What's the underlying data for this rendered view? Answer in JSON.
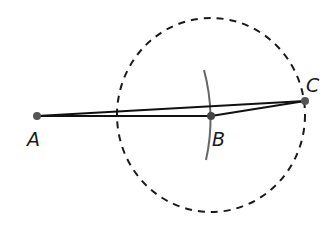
{
  "diagram": {
    "type": "geometric-construction",
    "points": [
      {
        "id": "A",
        "label": "A",
        "x": 37,
        "y": 116,
        "label_x": 27,
        "label_y": 146
      },
      {
        "id": "B",
        "label": "B",
        "x": 211,
        "y": 116,
        "label_x": 212,
        "label_y": 146
      },
      {
        "id": "C",
        "label": "C",
        "x": 305,
        "y": 101,
        "label_x": 306,
        "label_y": 92
      }
    ],
    "segments": [
      {
        "from": "A",
        "to": "B"
      },
      {
        "from": "B",
        "to": "C"
      },
      {
        "from": "A",
        "to": "C"
      }
    ],
    "circle": {
      "center": "B",
      "cx": 211,
      "cy": 115,
      "rx": 94,
      "ry": 97,
      "style": "dashed"
    },
    "arc": {
      "through": "B",
      "style": "solid",
      "color": "#555555"
    },
    "colors": {
      "line": "#111111",
      "point": "#555555",
      "arc": "#666666",
      "dashed": "#1a1a1a"
    }
  }
}
